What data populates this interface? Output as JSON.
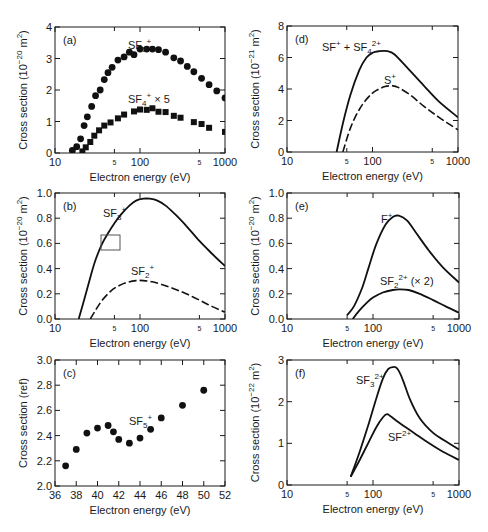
{
  "chart_data": [
    {
      "panel": "(a)",
      "type": "scatter",
      "xscale": "log",
      "xlim": [
        10,
        1000
      ],
      "ylim": [
        0,
        4
      ],
      "xticks": [
        "10",
        "5",
        "100",
        "5",
        "1000"
      ],
      "yticks": [
        "0",
        "1",
        "2",
        "3",
        "4"
      ],
      "xlabel": "Electron energy (eV)",
      "ylabel": "Cross section (10⁻²⁰ m²)",
      "series": [
        {
          "name": "SF5+",
          "marker": "circle",
          "x": [
            16,
            18,
            20,
            22,
            24,
            27,
            30,
            34,
            38,
            42,
            47,
            55,
            65,
            75,
            85,
            100,
            120,
            140,
            165,
            200,
            250,
            300,
            360,
            430,
            530,
            650,
            800,
            1000
          ],
          "y": [
            0.08,
            0.2,
            0.45,
            0.87,
            1.15,
            1.48,
            1.82,
            2.0,
            2.33,
            2.55,
            2.72,
            2.95,
            3.05,
            3.2,
            3.12,
            3.3,
            3.3,
            3.3,
            3.28,
            3.2,
            3.02,
            2.92,
            2.75,
            2.58,
            2.37,
            2.17,
            1.97,
            1.75
          ]
        },
        {
          "name": "SF4+ × 5",
          "marker": "square",
          "x": [
            21,
            23,
            26,
            29,
            33,
            38,
            45,
            55,
            65,
            85,
            100,
            120,
            140,
            165,
            200,
            250,
            300,
            430,
            530,
            650,
            1000
          ],
          "y": [
            0.05,
            0.18,
            0.35,
            0.55,
            0.72,
            0.87,
            0.97,
            1.1,
            1.22,
            1.32,
            1.38,
            1.37,
            1.42,
            1.31,
            1.3,
            1.18,
            1.12,
            0.98,
            0.92,
            0.8,
            0.67
          ]
        }
      ]
    },
    {
      "panel": "(b)",
      "type": "line",
      "xscale": "log",
      "xlim": [
        10,
        1000
      ],
      "ylim": [
        0,
        1.0
      ],
      "xticks": [
        "10",
        "5",
        "100",
        "5",
        "1000"
      ],
      "yticks": [
        "0.0",
        "0.2",
        "0.4",
        "0.6",
        "0.8",
        "1.0"
      ],
      "xlabel": "Electron energy (eV)",
      "ylabel": "Cross section (10⁻²⁰ m²)",
      "annotation": "small rectangle near 40-52 eV, 0.55-0.68",
      "series": [
        {
          "name": "SF3+",
          "style": "solid",
          "x": [
            19,
            22,
            26,
            30,
            36,
            42,
            50,
            60,
            75,
            90,
            110,
            130,
            160,
            200,
            260,
            350,
            500,
            700,
            1000
          ],
          "y": [
            0,
            0.15,
            0.33,
            0.47,
            0.6,
            0.68,
            0.76,
            0.83,
            0.9,
            0.94,
            0.955,
            0.955,
            0.94,
            0.9,
            0.83,
            0.74,
            0.62,
            0.52,
            0.42
          ]
        },
        {
          "name": "SF2+",
          "style": "dashed",
          "x": [
            26,
            30,
            36,
            45,
            55,
            70,
            90,
            110,
            140,
            180,
            250,
            350,
            500,
            700,
            1000
          ],
          "y": [
            0,
            0.07,
            0.15,
            0.22,
            0.26,
            0.29,
            0.305,
            0.305,
            0.295,
            0.275,
            0.24,
            0.2,
            0.15,
            0.1,
            0.055
          ]
        }
      ]
    },
    {
      "panel": "(c)",
      "type": "scatter",
      "xscale": "linear",
      "xlim": [
        36,
        52
      ],
      "ylim": [
        2.0,
        3.0
      ],
      "xticks": [
        "36",
        "38",
        "40",
        "42",
        "44",
        "46",
        "48",
        "50",
        "52"
      ],
      "yticks": [
        "2.0",
        "2.2",
        "2.4",
        "2.6",
        "2.8",
        "3.0"
      ],
      "xlabel": "Electron energy (eV)",
      "ylabel": "Cross section (ref)",
      "series": [
        {
          "name": "SF5+",
          "marker": "circle",
          "x": [
            37,
            38,
            39,
            40,
            41,
            41.5,
            42,
            43,
            44,
            45,
            46,
            48,
            50
          ],
          "y": [
            2.16,
            2.29,
            2.42,
            2.46,
            2.48,
            2.43,
            2.37,
            2.34,
            2.38,
            2.45,
            2.54,
            2.64,
            2.76
          ]
        }
      ]
    },
    {
      "panel": "(d)",
      "type": "line",
      "xscale": "log",
      "xlim": [
        10,
        1000
      ],
      "ylim": [
        0,
        8
      ],
      "xticks": [
        "10",
        "5",
        "100",
        "5",
        "1000"
      ],
      "yticks": [
        "0",
        "2",
        "4",
        "6",
        "8"
      ],
      "xlabel": "Electron energy (eV)",
      "ylabel": "Cross section (10⁻²¹ m²)",
      "series": [
        {
          "name": "SF+ + SF4 2+",
          "style": "solid",
          "x": [
            38,
            45,
            55,
            70,
            85,
            100,
            120,
            150,
            180,
            250,
            400,
            600,
            1000
          ],
          "y": [
            0,
            1.8,
            3.6,
            5.2,
            6.0,
            6.3,
            6.4,
            6.4,
            6.2,
            5.4,
            4.2,
            3.2,
            2.2
          ]
        },
        {
          "name": "S+",
          "style": "dashed",
          "x": [
            45,
            55,
            70,
            90,
            110,
            140,
            170,
            200,
            280,
            400,
            600,
            1000
          ],
          "y": [
            0,
            1.5,
            2.7,
            3.5,
            3.9,
            4.15,
            4.2,
            4.1,
            3.6,
            2.9,
            2.2,
            1.4
          ]
        }
      ]
    },
    {
      "panel": "(e)",
      "type": "line",
      "xscale": "log",
      "xlim": [
        10,
        1000
      ],
      "ylim": [
        0,
        1.0
      ],
      "xticks": [
        "10",
        "5",
        "100",
        "5",
        "1000"
      ],
      "yticks": [
        "0.0",
        "0.2",
        "0.4",
        "0.6",
        "0.8",
        "1.0"
      ],
      "xlabel": "Electron energy (eV)",
      "ylabel": "Cross section (10⁻²⁰ m²)",
      "series": [
        {
          "name": "F+",
          "style": "solid",
          "x": [
            50,
            60,
            75,
            90,
            110,
            140,
            170,
            200,
            250,
            320,
            450,
            650,
            1000
          ],
          "y": [
            0.03,
            0.1,
            0.25,
            0.42,
            0.6,
            0.75,
            0.81,
            0.82,
            0.78,
            0.68,
            0.54,
            0.41,
            0.29
          ]
        },
        {
          "name": "SF2 2+ (× 2)",
          "style": "solid",
          "x": [
            58,
            70,
            85,
            100,
            130,
            170,
            200,
            260,
            350,
            500,
            700,
            1000
          ],
          "y": [
            0,
            0.07,
            0.13,
            0.17,
            0.21,
            0.23,
            0.235,
            0.23,
            0.2,
            0.15,
            0.1,
            0.05
          ]
        }
      ]
    },
    {
      "panel": "(f)",
      "type": "line",
      "xscale": "log",
      "xlim": [
        10,
        1000
      ],
      "ylim": [
        0,
        3
      ],
      "xticks": [
        "10",
        "5",
        "100",
        "5",
        "1000"
      ],
      "yticks": [
        "0",
        "1",
        "2",
        "3"
      ],
      "xlabel": "Electron energy (eV)",
      "ylabel": "Cross section (10⁻²² m²)",
      "series": [
        {
          "name": "SF3 2+",
          "style": "solid",
          "x": [
            55,
            70,
            90,
            110,
            130,
            150,
            170,
            190,
            220,
            270,
            350,
            500,
            700,
            1000
          ],
          "y": [
            0.2,
            0.8,
            1.5,
            2.1,
            2.55,
            2.78,
            2.83,
            2.8,
            2.55,
            2.05,
            1.6,
            1.25,
            1.05,
            0.85
          ]
        },
        {
          "name": "SF 2+",
          "style": "solid",
          "x": [
            55,
            70,
            90,
            110,
            130,
            145,
            160,
            200,
            300,
            450,
            650,
            1000
          ],
          "y": [
            0.2,
            0.6,
            1.05,
            1.4,
            1.62,
            1.7,
            1.65,
            1.5,
            1.25,
            1.0,
            0.8,
            0.6
          ]
        }
      ]
    }
  ],
  "labels": {
    "a": {
      "panel": "(a)",
      "sf5": "SF",
      "sf5_sub": "5",
      "sf5_sup": "+",
      "sf4": "SF",
      "sf4_sub": "4",
      "sf4_sup": "+",
      "sf4_mult": " × 5"
    },
    "b": {
      "panel": "(b)",
      "sf3": "SF",
      "sf3_sub": "3",
      "sf3_sup": "+",
      "sf2": "SF",
      "sf2_sub": "2",
      "sf2_sup": "+"
    },
    "c": {
      "panel": "(c)",
      "sf5": "SF",
      "sf5_sub": "5",
      "sf5_sup": "+"
    },
    "d": {
      "panel": "(d)",
      "sf": "SF",
      "sf_sup": "+",
      "plus": " + SF",
      "sf4_sub": "4",
      "sf4_sup": "2+",
      "s": "S",
      "s_sup": "+"
    },
    "e": {
      "panel": "(e)",
      "f": "F",
      "f_sup": "+",
      "sf2": "SF",
      "sf2_sub": "2",
      "sf2_sup": "2+",
      "mult": " (× 2)"
    },
    "f": {
      "panel": "(f)",
      "sf3": "SF",
      "sf3_sub": "3",
      "sf3_sup": "2+",
      "sf": "SF",
      "sf_sup": "2+"
    },
    "xlabel": "Electron energy (eV)",
    "ylabel_20": "Cross section (10",
    "ylabel_exp20": "−20",
    "ylabel_exp21": "−21",
    "ylabel_exp22": "−22",
    "ylabel_unit": " m",
    "ylabel_sq": "2",
    "ylabel_close": ")",
    "ylabel_ref": "Cross section (ref)"
  }
}
